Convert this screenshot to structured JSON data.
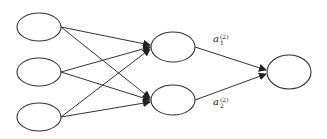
{
  "diagram": {
    "type": "neural-network",
    "colors": {
      "stroke": "#333333",
      "background": "#ffffff"
    },
    "layers": [
      {
        "name": "input",
        "nodes": [
          {
            "cx": 39,
            "cy": 27
          },
          {
            "cx": 39,
            "cy": 72
          },
          {
            "cx": 39,
            "cy": 117
          }
        ]
      },
      {
        "name": "hidden",
        "nodes": [
          {
            "cx": 173,
            "cy": 47
          },
          {
            "cx": 173,
            "cy": 100
          }
        ]
      },
      {
        "name": "output",
        "nodes": [
          {
            "cx": 289,
            "cy": 72
          }
        ]
      }
    ],
    "labels": [
      {
        "id": "a1",
        "base": "a",
        "superscript": "(2)",
        "subscript": "1"
      },
      {
        "id": "a2",
        "base": "a",
        "superscript": "(2)",
        "subscript": "2"
      }
    ]
  }
}
